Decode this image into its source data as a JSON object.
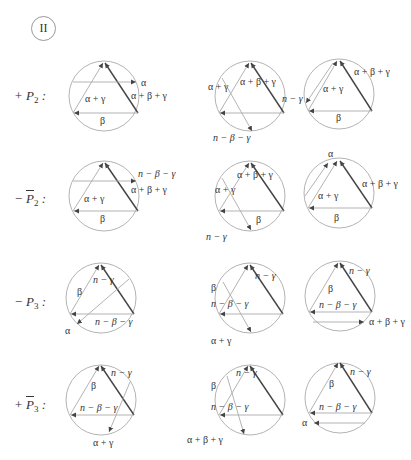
{
  "figure": {
    "section_numeral": "II",
    "rows": [
      {
        "label_sign": "+",
        "label_symbol": "P",
        "label_bar": false,
        "label_sub": "2",
        "label_suffix": " :",
        "panels": [
          {
            "labels": [
              "α",
              "α + β + γ",
              "α + γ",
              "β"
            ]
          },
          {
            "labels": [
              "α + γ",
              "α + β + γ",
              "n − β − γ"
            ]
          },
          {
            "labels": [
              "α + β + γ",
              "n − γ",
              "α + γ",
              "β"
            ]
          }
        ]
      },
      {
        "label_sign": "−",
        "label_symbol": "P",
        "label_bar": true,
        "label_sub": "2",
        "label_suffix": " :",
        "panels": [
          {
            "labels": [
              "n − β − γ",
              "α + β + γ",
              "α + γ",
              "β"
            ]
          },
          {
            "labels": [
              "α + β + γ",
              "α + γ",
              "β",
              "n − γ"
            ]
          },
          {
            "labels": [
              "α",
              "α + β + γ",
              "α + γ",
              "β"
            ]
          }
        ]
      },
      {
        "label_sign": "−",
        "label_symbol": "P",
        "label_bar": false,
        "label_sub": "3",
        "label_suffix": " :",
        "panels": [
          {
            "labels": [
              "n − γ",
              "β",
              "n − β − γ",
              "α"
            ]
          },
          {
            "labels": [
              "n − γ",
              "β",
              "n − β − γ",
              "α + γ"
            ]
          },
          {
            "labels": [
              "n − γ",
              "β",
              "n − β − γ",
              "α + β + γ"
            ]
          }
        ]
      },
      {
        "label_sign": "+",
        "label_symbol": "P",
        "label_bar": true,
        "label_sub": "3",
        "label_suffix": " :",
        "panels": [
          {
            "labels": [
              "n − γ",
              "β",
              "n − β − γ",
              "α + γ"
            ]
          },
          {
            "labels": [
              "n − γ",
              "β",
              "n − β − γ",
              "α + β + γ"
            ]
          },
          {
            "labels": [
              "n − γ",
              "β",
              "n − β − γ",
              "α"
            ]
          }
        ]
      }
    ]
  }
}
